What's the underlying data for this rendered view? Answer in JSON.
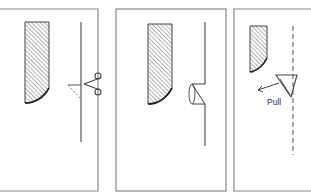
{
  "figure": {
    "panels": [
      {
        "id": 1,
        "step": "cut",
        "icon": "scissors-icon"
      },
      {
        "id": 2,
        "step": "fold",
        "icon": "folded-flap"
      },
      {
        "id": 3,
        "step": "pull",
        "label": "Pull",
        "icon": "pull-arrow"
      }
    ],
    "colors": {
      "line": "#555555",
      "border": "#888888",
      "background": "#ffffff"
    }
  }
}
